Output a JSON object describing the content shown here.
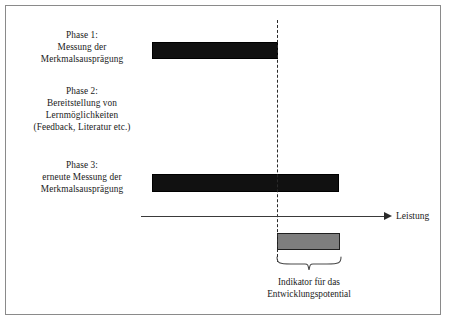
{
  "figure": {
    "background_color": "#ffffff",
    "frame_color": "#8a8a8a"
  },
  "phases": [
    {
      "id": "phase-1",
      "lines": [
        "Phase 1:",
        "Messung der",
        "Merkmalsausprägung"
      ],
      "bar": {
        "color": "#111111",
        "type": "measurement",
        "ends_at_reference_line": true
      }
    },
    {
      "id": "phase-2",
      "lines": [
        "Phase 2:",
        "Bereitstellung von",
        "Lernmöglichkeiten",
        "(Feedback, Literatur etc.)"
      ],
      "bar": null
    },
    {
      "id": "phase-3",
      "lines": [
        "Phase 3:",
        "erneute Messung der",
        "Merkmalsausprägung"
      ],
      "bar": {
        "color": "#111111",
        "type": "measurement",
        "ends_at_reference_line": false
      }
    }
  ],
  "axis": {
    "label": "Leistung",
    "arrow": "right",
    "line_color": "#3a3a3a"
  },
  "reference_line": {
    "style": "dashed",
    "color": "#2a2a2a"
  },
  "indicator": {
    "bar_color": "#7e7e7e",
    "caption_lines": [
      "Indikator für das",
      "Entwicklungspotential"
    ],
    "brace": "curly-brace-down"
  }
}
